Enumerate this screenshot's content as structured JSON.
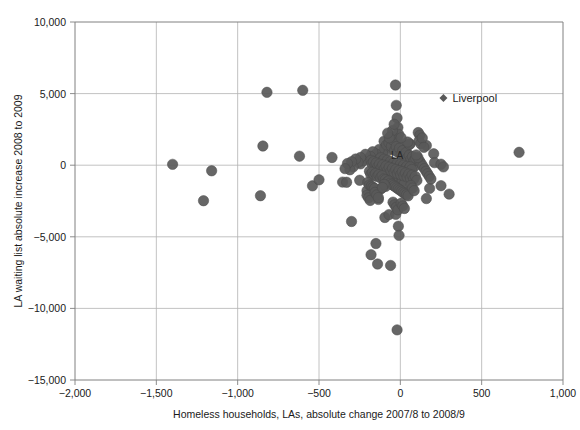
{
  "chart_data": {
    "type": "scatter",
    "title": "",
    "xlabel": "Homeless households, LAs, absolute change 2007/8 to 2008/9",
    "ylabel": "LA waiting list absolute increase 2008 to 2009",
    "xlim": [
      -2000,
      1000
    ],
    "ylim": [
      -15000,
      10000
    ],
    "xticks": [
      -2000,
      -1500,
      -1000,
      -500,
      0,
      500,
      1000
    ],
    "xtick_labels": [
      "−2,000",
      "−1,500",
      "−1,000",
      "−500",
      "0",
      "500",
      "1,000"
    ],
    "yticks": [
      -15000,
      -10000,
      -5000,
      0,
      5000,
      10000
    ],
    "ytick_labels": [
      "−15,000",
      "−10,000",
      "−5,000",
      "0",
      "5,000",
      "10,000"
    ],
    "grid": true,
    "legend": "none",
    "marker_color": "#595959",
    "marker_size": 5.2,
    "grid_color": "#b3b3b3",
    "axis_color": "#808080",
    "annotations": [
      {
        "name": "liverpool-annotation",
        "label": "Liverpool",
        "x": 265,
        "y": 4700,
        "marker": "diamond"
      },
      {
        "name": "la-cluster-annotation",
        "label": "LA",
        "x": -20,
        "y": 420,
        "marker": "none"
      }
    ],
    "points": [
      [
        -1400,
        60
      ],
      [
        -1160,
        -390
      ],
      [
        -1210,
        -2480
      ],
      [
        -860,
        -2130
      ],
      [
        -845,
        1340
      ],
      [
        -820,
        5090
      ],
      [
        -600,
        5230
      ],
      [
        -540,
        -1440
      ],
      [
        -620,
        630
      ],
      [
        -500,
        -1020
      ],
      [
        -420,
        540
      ],
      [
        -355,
        -1180
      ],
      [
        -330,
        -1190
      ],
      [
        -300,
        -3930
      ],
      [
        -250,
        -1050
      ],
      [
        -245,
        90
      ],
      [
        -205,
        -1780
      ],
      [
        -180,
        -6250
      ],
      [
        -150,
        -5470
      ],
      [
        -140,
        -6900
      ],
      [
        -135,
        -2390
      ],
      [
        -120,
        -1660
      ],
      [
        -95,
        -3650
      ],
      [
        -70,
        -3450
      ],
      [
        -60,
        -7000
      ],
      [
        -30,
        5600
      ],
      [
        -25,
        4180
      ],
      [
        -20,
        3300
      ],
      [
        -15,
        2640
      ],
      [
        -10,
        2160
      ],
      [
        -18,
        1860
      ],
      [
        -28,
        -3430
      ],
      [
        -12,
        -4260
      ],
      [
        -8,
        -4900
      ],
      [
        -20,
        -11500
      ],
      [
        110,
        2280
      ],
      [
        120,
        2100
      ],
      [
        160,
        1380
      ],
      [
        205,
        800
      ],
      [
        210,
        180
      ],
      [
        250,
        70
      ],
      [
        265,
        -120
      ],
      [
        300,
        -2020
      ],
      [
        250,
        -1430
      ],
      [
        180,
        -1620
      ],
      [
        160,
        -2330
      ],
      [
        730,
        900
      ],
      [
        90,
        -60
      ],
      [
        60,
        1480
      ],
      [
        35,
        1120
      ],
      [
        -5,
        1420
      ],
      [
        -40,
        1600
      ],
      [
        -60,
        1180
      ],
      [
        -80,
        980
      ],
      [
        -95,
        1250
      ],
      [
        -110,
        860
      ],
      [
        -130,
        1100
      ],
      [
        -150,
        780
      ],
      [
        -170,
        940
      ],
      [
        -185,
        620
      ],
      [
        -200,
        420
      ],
      [
        -215,
        760
      ],
      [
        -230,
        300
      ],
      [
        -245,
        540
      ],
      [
        -260,
        200
      ],
      [
        -275,
        430
      ],
      [
        -290,
        -120
      ],
      [
        -300,
        240
      ],
      [
        -310,
        -320
      ],
      [
        -325,
        120
      ],
      [
        -340,
        -240
      ],
      [
        -100,
        1680
      ],
      [
        -85,
        1420
      ],
      [
        -70,
        1560
      ],
      [
        -55,
        1320
      ],
      [
        -45,
        1760
      ],
      [
        -35,
        1040
      ],
      [
        -25,
        1300
      ],
      [
        -15,
        900
      ],
      [
        -5,
        1180
      ],
      [
        5,
        760
      ],
      [
        15,
        1020
      ],
      [
        25,
        640
      ],
      [
        35,
        880
      ],
      [
        45,
        520
      ],
      [
        55,
        700
      ],
      [
        65,
        400
      ],
      [
        75,
        600
      ],
      [
        85,
        320
      ],
      [
        95,
        480
      ],
      [
        -120,
        520
      ],
      [
        -110,
        280
      ],
      [
        -100,
        420
      ],
      [
        -90,
        160
      ],
      [
        -80,
        340
      ],
      [
        -70,
        80
      ],
      [
        -60,
        260
      ],
      [
        -50,
        20
      ],
      [
        -40,
        180
      ],
      [
        -30,
        -60
      ],
      [
        -20,
        120
      ],
      [
        -10,
        -140
      ],
      [
        0,
        60
      ],
      [
        10,
        -180
      ],
      [
        20,
        0
      ],
      [
        30,
        -220
      ],
      [
        40,
        -80
      ],
      [
        50,
        -260
      ],
      [
        60,
        -120
      ],
      [
        70,
        -300
      ],
      [
        -140,
        60
      ],
      [
        -130,
        -160
      ],
      [
        -120,
        -20
      ],
      [
        -110,
        -240
      ],
      [
        -100,
        -100
      ],
      [
        -90,
        -320
      ],
      [
        -80,
        -180
      ],
      [
        -70,
        -400
      ],
      [
        -60,
        -260
      ],
      [
        -50,
        -480
      ],
      [
        -40,
        -340
      ],
      [
        -30,
        -560
      ],
      [
        -20,
        -420
      ],
      [
        -10,
        -640
      ],
      [
        0,
        -500
      ],
      [
        10,
        -720
      ],
      [
        20,
        -580
      ],
      [
        30,
        -800
      ],
      [
        40,
        -660
      ],
      [
        50,
        -880
      ],
      [
        -160,
        -340
      ],
      [
        -150,
        -560
      ],
      [
        -145,
        -420
      ],
      [
        -135,
        -640
      ],
      [
        -125,
        -500
      ],
      [
        -115,
        -720
      ],
      [
        -105,
        -580
      ],
      [
        -95,
        -800
      ],
      [
        -85,
        -660
      ],
      [
        -75,
        -880
      ],
      [
        -65,
        -740
      ],
      [
        -55,
        -960
      ],
      [
        -45,
        -820
      ],
      [
        -35,
        -1040
      ],
      [
        -25,
        -900
      ],
      [
        -15,
        -1120
      ],
      [
        -5,
        -980
      ],
      [
        5,
        -1200
      ],
      [
        15,
        -1060
      ],
      [
        25,
        -1280
      ],
      [
        -180,
        340
      ],
      [
        -175,
        100
      ],
      [
        -165,
        240
      ],
      [
        -155,
        -20
      ],
      [
        -148,
        160
      ],
      [
        -138,
        -100
      ],
      [
        -128,
        80
      ],
      [
        -118,
        -180
      ],
      [
        -108,
        20
      ],
      [
        -98,
        -260
      ],
      [
        -88,
        -60
      ],
      [
        -78,
        -340
      ],
      [
        -68,
        -140
      ],
      [
        -58,
        -420
      ],
      [
        -48,
        -220
      ],
      [
        -38,
        -500
      ],
      [
        -28,
        -300
      ],
      [
        -18,
        -580
      ],
      [
        -8,
        -380
      ],
      [
        2,
        -660
      ],
      [
        12,
        -460
      ],
      [
        22,
        -740
      ],
      [
        32,
        -540
      ],
      [
        42,
        -820
      ],
      [
        52,
        -620
      ],
      [
        62,
        -900
      ],
      [
        72,
        -700
      ],
      [
        82,
        -980
      ],
      [
        92,
        -780
      ],
      [
        102,
        -1060
      ],
      [
        -190,
        -420
      ],
      [
        -182,
        -640
      ],
      [
        -172,
        -500
      ],
      [
        -162,
        -720
      ],
      [
        -152,
        -580
      ],
      [
        -142,
        -800
      ],
      [
        -132,
        -660
      ],
      [
        -122,
        -880
      ],
      [
        -112,
        -740
      ],
      [
        -102,
        -960
      ],
      [
        -92,
        -1020
      ],
      [
        -82,
        -1180
      ],
      [
        -72,
        -1100
      ],
      [
        -62,
        -1260
      ],
      [
        -52,
        -1340
      ],
      [
        -42,
        -1420
      ],
      [
        -32,
        -1500
      ],
      [
        -22,
        -1580
      ],
      [
        -12,
        -1660
      ],
      [
        -2,
        -1740
      ],
      [
        8,
        -1820
      ],
      [
        18,
        -1900
      ],
      [
        28,
        -1980
      ],
      [
        38,
        -2060
      ],
      [
        48,
        -2140
      ],
      [
        -200,
        -1200
      ],
      [
        -190,
        -1380
      ],
      [
        -178,
        -1460
      ],
      [
        -168,
        -1540
      ],
      [
        -158,
        -1620
      ],
      [
        118,
        300
      ],
      [
        128,
        120
      ],
      [
        138,
        -60
      ],
      [
        148,
        -240
      ],
      [
        158,
        -420
      ],
      [
        168,
        -600
      ],
      [
        178,
        -780
      ],
      [
        188,
        -960
      ],
      [
        108,
        540
      ],
      [
        98,
        720
      ],
      [
        -58,
        2040
      ],
      [
        -48,
        2420
      ],
      [
        -38,
        2860
      ],
      [
        -68,
        1920
      ],
      [
        -78,
        2240
      ],
      [
        115,
        1700
      ],
      [
        125,
        1500
      ],
      [
        135,
        1900
      ],
      [
        145,
        1250
      ],
      [
        -205,
        -2100
      ],
      [
        -195,
        -2280
      ],
      [
        -185,
        -2460
      ],
      [
        -45,
        -2580
      ],
      [
        -35,
        -2760
      ],
      [
        -25,
        -2940
      ],
      [
        -15,
        -3120
      ],
      [
        5,
        -2660
      ],
      [
        15,
        -2840
      ],
      [
        25,
        -3020
      ],
      [
        -155,
        -1900
      ],
      [
        -145,
        -2080
      ],
      [
        -135,
        -2260
      ],
      [
        65,
        -1420
      ],
      [
        75,
        -1600
      ],
      [
        85,
        -1780
      ],
      [
        -90,
        -1480
      ],
      [
        -100,
        -1340
      ],
      [
        -110,
        -1560
      ],
      [
        55,
        1460
      ],
      [
        45,
        1620
      ],
      [
        5,
        1920
      ]
    ]
  }
}
